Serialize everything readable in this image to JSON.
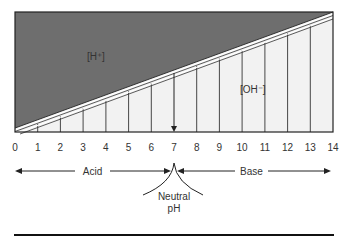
{
  "diagram": {
    "regions": {
      "acid_ion": "[H⁺]",
      "base_ion": "[OH⁻]"
    },
    "scale": {
      "ticks": [
        "0",
        "1",
        "2",
        "3",
        "4",
        "5",
        "6",
        "7",
        "8",
        "9",
        "10",
        "11",
        "12",
        "13",
        "14"
      ]
    },
    "arrows": {
      "acid_label": "Acid",
      "base_label": "Base",
      "neutral_line1": "Neutral",
      "neutral_line2": "pH"
    },
    "colors": {
      "acid_fill": "#6e6e6e",
      "base_fill": "#f2f2f2",
      "lines": "#222222"
    }
  }
}
